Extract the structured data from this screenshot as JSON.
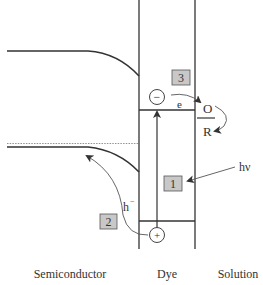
{
  "diagram": {
    "type": "energy-band-diagram",
    "regions": {
      "semiconductor": "Semiconductor",
      "dye": "Dye",
      "solution": "Solution"
    },
    "steps": [
      {
        "id": "step-3",
        "label": "3"
      },
      {
        "id": "step-1",
        "label": "1"
      },
      {
        "id": "step-2",
        "label": "2"
      }
    ],
    "charges": {
      "electron_symbol": "−",
      "hole_symbol": "+",
      "electron_label": "e",
      "hole_label": "h",
      "hole_superscript": "−"
    },
    "redox": {
      "oxidized": "O",
      "reduced": "R"
    },
    "light": {
      "label": "hν"
    },
    "colors": {
      "line": "#333333",
      "box_fill": "#c8c8c8",
      "box_stroke": "#555555",
      "dotted": "#777777"
    }
  }
}
